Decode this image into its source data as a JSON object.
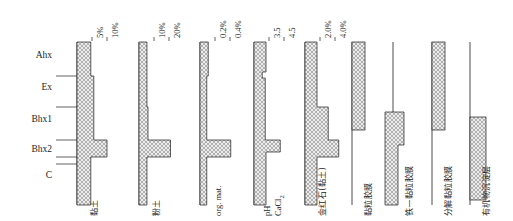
{
  "figure": {
    "type": "soil-profile-diagram",
    "background": "#ffffff",
    "ink": "#1d1d1d",
    "hatch_fill": "#e8e8e8",
    "hatch_line": "#8a8a8a"
  },
  "horizons": {
    "axis_label": "",
    "items": [
      {
        "label": "Ahx",
        "y_top": 44,
        "y_bottom": 76,
        "label_y": 57
      },
      {
        "label": "Ex",
        "y_top": 76,
        "y_bottom": 107,
        "label_y": 89
      },
      {
        "label": "Bhx1",
        "y_top": 107,
        "y_bottom": 140,
        "label_y": 121
      },
      {
        "label": "Bhx2",
        "y_top": 140,
        "y_bottom": 157,
        "label_y": 151
      },
      {
        "label": "C",
        "y_top": 157,
        "y_bottom": 200,
        "label_y": 177
      }
    ],
    "boundary_ticks": [
      76,
      107,
      140,
      157
    ]
  },
  "panels": [
    {
      "id": "clay",
      "bottom_label": "黏土",
      "bottom_label_kind": "cjk",
      "baseline_x": 77,
      "axis_top": 42,
      "axis_bottom": 205,
      "scale_px_per_unit": 3.0,
      "ticks": [
        {
          "value": "5%",
          "x": 92
        },
        {
          "value": "10%",
          "x": 107
        }
      ],
      "segments": [
        {
          "horizon": "Ahx",
          "value": 4.6,
          "y_top": 42,
          "y_bottom": 76
        },
        {
          "horizon": "Ex",
          "value": 5.6,
          "y_top": 76,
          "y_bottom": 140
        },
        {
          "horizon": "Bhx2",
          "value": 10.0,
          "y_top": 140,
          "y_bottom": 157
        },
        {
          "horizon": "C",
          "value": 4.6,
          "y_top": 157,
          "y_bottom": 205
        }
      ]
    },
    {
      "id": "silt",
      "bottom_label": "粉土",
      "bottom_label_kind": "cjk",
      "baseline_x": 139,
      "axis_top": 42,
      "axis_bottom": 205,
      "scale_px_per_unit": 1.5,
      "ticks": [
        {
          "value": "10%",
          "x": 154
        },
        {
          "value": "20%",
          "x": 169
        }
      ],
      "segments": [
        {
          "horizon": "Ahx",
          "value": 5.3,
          "y_top": 42,
          "y_bottom": 107
        },
        {
          "horizon": "Bhx1",
          "value": 6.0,
          "y_top": 107,
          "y_bottom": 140
        },
        {
          "horizon": "Bhx2",
          "value": 21.0,
          "y_top": 140,
          "y_bottom": 157
        },
        {
          "horizon": "C",
          "value": 5.3,
          "y_top": 157,
          "y_bottom": 205
        }
      ]
    },
    {
      "id": "org-mat",
      "bottom_label": "org. mat.",
      "bottom_label_kind": "latin",
      "baseline_x": 200,
      "axis_top": 42,
      "axis_bottom": 205,
      "scale_px_per_unit": 75,
      "ticks": [
        {
          "value": "0.2%",
          "x": 215
        },
        {
          "value": "0.4%",
          "x": 230
        }
      ],
      "segments": [
        {
          "horizon": "Ahx",
          "value": 0.11,
          "y_top": 42,
          "y_bottom": 76
        },
        {
          "horizon": "Ex",
          "value": 0.09,
          "y_top": 76,
          "y_bottom": 140
        },
        {
          "horizon": "Bhx2",
          "value": 0.41,
          "y_top": 140,
          "y_bottom": 157
        },
        {
          "horizon": "C",
          "value": 0.09,
          "y_top": 157,
          "y_bottom": 205
        }
      ]
    },
    {
      "id": "ph",
      "bottom_label_line1": "pH",
      "bottom_label_line2": "CaCl",
      "bottom_label_sub": "2",
      "bottom_label_kind": "latin",
      "baseline_x": 254,
      "axis_top": 42,
      "axis_bottom": 205,
      "scale_px_per_unit": 15,
      "ticks": [
        {
          "value": "3.5",
          "x": 269
        },
        {
          "value": "4.5",
          "x": 284
        }
      ],
      "segments": [
        {
          "horizon": "Ahx",
          "value": 0.8,
          "y_top": 42,
          "y_bottom": 72
        },
        {
          "horizon": "Ex",
          "value": 0.55,
          "y_top": 72,
          "y_bottom": 78
        },
        {
          "horizon": "Bhx1",
          "value": 0.75,
          "y_top": 78,
          "y_bottom": 140
        },
        {
          "horizon": "Bhx2",
          "value": 1.75,
          "y_top": 140,
          "y_bottom": 152
        },
        {
          "horizon": "C",
          "value": 0.8,
          "y_top": 152,
          "y_bottom": 205
        }
      ]
    },
    {
      "id": "rutile",
      "bottom_label": "金红石(黏土)",
      "bottom_label_kind": "cjk",
      "baseline_x": 305,
      "axis_top": 42,
      "axis_bottom": 205,
      "scale_px_per_unit": 7.5,
      "ticks": [
        {
          "value": "2.0%",
          "x": 320
        },
        {
          "value": "4.0%",
          "x": 335
        }
      ],
      "segments": [
        {
          "horizon": "Ahx",
          "value": 1.6,
          "y_top": 42,
          "y_bottom": 107
        },
        {
          "horizon": "Bhx1",
          "value": 3.1,
          "y_top": 107,
          "y_bottom": 140
        },
        {
          "horizon": "Bhx2",
          "value": 4.5,
          "y_top": 140,
          "y_bottom": 157
        },
        {
          "horizon": "C",
          "value": 1.6,
          "y_top": 157,
          "y_bottom": 205
        }
      ]
    }
  ],
  "feature_panels": [
    {
      "id": "clay-coating",
      "label": "黏粒胶膜",
      "baseline_x": 352,
      "bar_x": 352,
      "bar_width": 13,
      "bar_top": 42,
      "bar_bottom": 130,
      "axis_top": 42,
      "axis_bottom": 205
    },
    {
      "id": "iron-clay-coating",
      "label": "铁—黏粒胶膜",
      "baseline_x": 393,
      "bar_x": 385,
      "bar_width": 19,
      "bar_top": 112,
      "bar_bottom": 205,
      "bar_step_x": 385,
      "bar_step_width": 13,
      "bar_step_top": 145,
      "axis_top": 42,
      "axis_bottom": 205
    },
    {
      "id": "decomposed-clay-coating",
      "label": "分解黏粒胶膜",
      "baseline_x": 432,
      "bar_x": 432,
      "bar_width": 13,
      "bar_top": 42,
      "bar_bottom": 130,
      "axis_top": 42,
      "axis_bottom": 205
    },
    {
      "id": "organic-precipitate-layer",
      "label": "有机物沉淀层",
      "baseline_x": 470,
      "bar_x": 470,
      "bar_width": 16,
      "bar_top": 117,
      "bar_bottom": 200,
      "axis_top": 42,
      "axis_bottom": 205
    }
  ],
  "chart_data": {
    "type": "bar",
    "title": "",
    "xlabel": "",
    "ylabel": "",
    "categories": [
      "Ahx",
      "Ex",
      "Bhx1",
      "Bhx2",
      "C"
    ],
    "series": [
      {
        "name": "黏土",
        "unit": "%",
        "axis_ticks": [
          "5%",
          "10%"
        ],
        "values": [
          4.6,
          5.6,
          5.6,
          10.0,
          4.6
        ]
      },
      {
        "name": "粉土",
        "unit": "%",
        "axis_ticks": [
          "10%",
          "20%"
        ],
        "values": [
          5.3,
          5.3,
          6.0,
          21.0,
          5.3
        ]
      },
      {
        "name": "org. mat.",
        "unit": "%",
        "axis_ticks": [
          "0.2%",
          "0.4%"
        ],
        "values": [
          0.11,
          0.09,
          0.09,
          0.41,
          0.09
        ]
      },
      {
        "name": "pH CaCl2",
        "unit": "pH",
        "axis_ticks": [
          "3.5",
          "4.5"
        ],
        "values": [
          4.05,
          3.85,
          4.0,
          5.2,
          4.05
        ]
      },
      {
        "name": "金红石(黏土)",
        "unit": "%",
        "axis_ticks": [
          "2.0%",
          "4.0%"
        ],
        "values": [
          1.6,
          1.6,
          3.1,
          4.5,
          1.6
        ]
      }
    ],
    "presence_series": [
      {
        "name": "黏粒胶膜",
        "present_in": [
          "Ahx",
          "Ex",
          "Bhx1"
        ]
      },
      {
        "name": "铁—黏粒胶膜",
        "present_in": [
          "Bhx1",
          "Bhx2",
          "C"
        ]
      },
      {
        "name": "分解黏粒胶膜",
        "present_in": [
          "Ahx",
          "Ex",
          "Bhx1"
        ]
      },
      {
        "name": "有机物沉淀层",
        "present_in": [
          "Bhx1",
          "Bhx2",
          "C"
        ]
      }
    ],
    "grid": false,
    "legend": "none"
  }
}
